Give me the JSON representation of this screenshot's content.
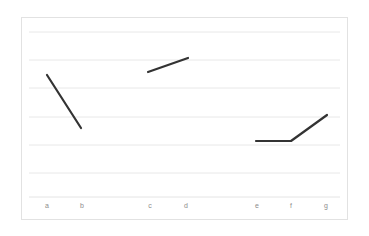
{
  "chart_data": {
    "type": "line",
    "title": "",
    "subtitle": "",
    "xlabel": "",
    "ylabel": "",
    "categories": [
      "a",
      "b",
      "c",
      "d",
      "e",
      "f",
      "g"
    ],
    "grid": true,
    "legend": null,
    "ylim": [
      0,
      7
    ],
    "gridline_count": 7,
    "series": [
      {
        "name": "segment-ab",
        "x": [
          "a",
          "b"
        ],
        "values": [
          5.3,
          3.4
        ]
      },
      {
        "name": "segment-cd",
        "x": [
          "c",
          "d"
        ],
        "values": [
          5.2,
          5.7
        ]
      },
      {
        "name": "segment-efg",
        "x": [
          "e",
          "f",
          "g"
        ],
        "values": [
          2.9,
          2.9,
          3.8
        ]
      }
    ],
    "points": [
      {
        "label": "a",
        "x": 47,
        "y": 75
      },
      {
        "label": "b",
        "x": 81,
        "y": 128
      },
      {
        "label": "c",
        "x": 148,
        "y": 72
      },
      {
        "label": "d",
        "x": 188,
        "y": 58
      },
      {
        "label": "e",
        "x": 256,
        "y": 141
      },
      {
        "label": "f",
        "x": 291,
        "y": 141
      },
      {
        "label": "g",
        "x": 327,
        "y": 115
      }
    ],
    "colors": {
      "line": "#333333",
      "gridline": "#e8e8e8",
      "border": "#e2e2e2",
      "tick_label": "#8d8d8d",
      "background": "#ffffff"
    },
    "axis": {
      "x_tick_positions": [
        47,
        82,
        150,
        186,
        257,
        291,
        326
      ],
      "gridline_y": [
        32,
        60,
        88,
        117,
        145,
        173,
        200
      ]
    }
  }
}
